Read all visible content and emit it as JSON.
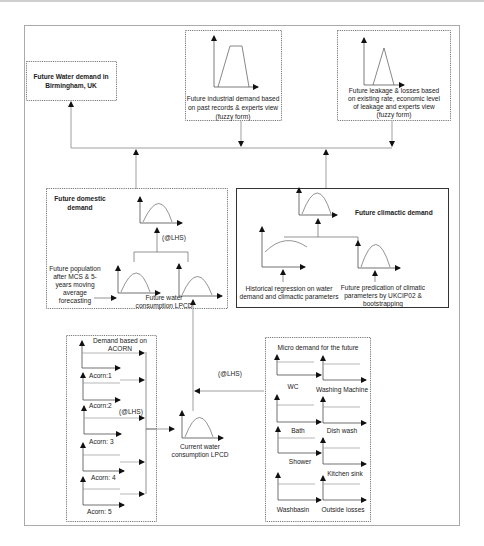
{
  "diagram": {
    "title_box": {
      "lines": [
        "Future Water demand in",
        "Birmingham, UK"
      ]
    },
    "industrial_box": {
      "lines": [
        "Future industrial demand based",
        "on past records & experts view",
        "(fuzzy form)"
      ]
    },
    "leakage_box": {
      "lines": [
        "Future leakage & losses based",
        "on existing rate, economic level",
        "of leakage and experts view",
        "(fuzzy form)"
      ]
    },
    "domestic_box": {
      "title_lines": [
        "Future domestic",
        "demand"
      ],
      "lhs_label": "(@LHS)",
      "population_lines": [
        "Future population",
        "after MCS & 5-",
        "years  moving",
        "average",
        "forecasting"
      ],
      "consumption_lines": [
        "Future water",
        "consumption LPCD"
      ]
    },
    "climactic_box": {
      "title": "Future climactic demand",
      "historical_lines": [
        "Historical regression on water",
        "demand and climactic parameters"
      ],
      "future_lines": [
        "Future predication of climatic",
        "parameters by UKCIP02 &",
        "bootstrapping"
      ]
    },
    "acorn_box": {
      "title_lines": [
        "Demand based on",
        "ACORN"
      ],
      "items": [
        "Acorn:1",
        "Acorn:2",
        "Acorn: 3",
        "Acorn: 4",
        "Acorn: 5"
      ],
      "lhs_label": "(@LHS)"
    },
    "current_consumption": {
      "lines": [
        "Current water",
        "consumption LPCD"
      ]
    },
    "middle_lhs_label": "(@LHS)",
    "micro_box": {
      "title": "Micro demand for the future",
      "left_items": [
        "WC",
        "Bath",
        "Shower",
        "Washbasin"
      ],
      "right_items": [
        "Washing Machine",
        "Dish wash",
        "Kitchen sink",
        "Outside  losses"
      ]
    }
  }
}
